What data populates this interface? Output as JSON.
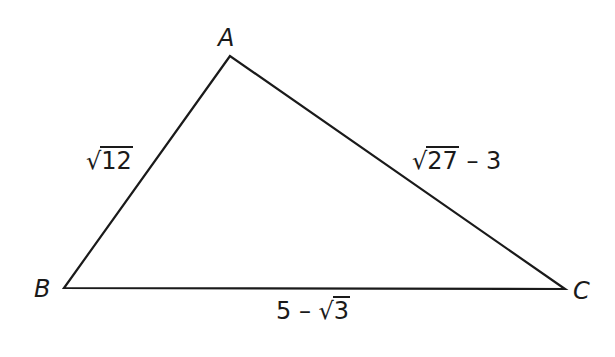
{
  "figure": {
    "type": "triangle",
    "stroke_color": "#1a1a1a",
    "vertices": {
      "A": {
        "label": "A",
        "x": 230,
        "y": 56
      },
      "B": {
        "label": "B",
        "x": 64,
        "y": 288
      },
      "C": {
        "label": "C",
        "x": 565,
        "y": 289
      }
    },
    "sides": {
      "AB": {
        "radical": "12",
        "prefix": "",
        "suffix": "",
        "text": "√12"
      },
      "AC": {
        "radical": "27",
        "prefix": "",
        "suffix": " – 3",
        "text": "√27 – 3"
      },
      "BC": {
        "radical": "3",
        "prefix": "5 – ",
        "suffix": "",
        "text": "5 – √3"
      }
    }
  }
}
